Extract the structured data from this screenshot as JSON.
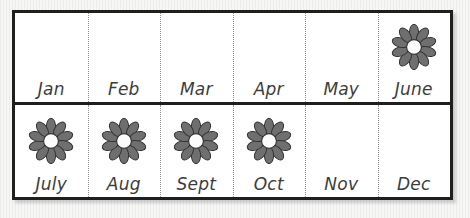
{
  "chart_data": {
    "type": "table",
    "title": "",
    "xlabel": "",
    "ylabel": "",
    "grid": {
      "rows": 2,
      "columns": 6
    },
    "symbol": {
      "name": "flower-icon",
      "petals": 10,
      "meaning": "flower blooms this month"
    },
    "categories": [
      "Jan",
      "Feb",
      "Mar",
      "Apr",
      "May",
      "June",
      "July",
      "Aug",
      "Sept",
      "Oct",
      "Nov",
      "Dec"
    ],
    "values": [
      0,
      0,
      0,
      0,
      0,
      1,
      1,
      1,
      1,
      1,
      0,
      0
    ],
    "legend_position": "none",
    "grid_on": true
  },
  "colors": {
    "frame_border": "#201f1f",
    "cell_background": "#ffffff",
    "separator": "#8e8e8e",
    "label_text": "#3c3c3c",
    "petal_fill": "#6f6f6f",
    "petal_stroke": "#333333",
    "flower_center": "#fbfbfb",
    "page_background": "#f2f2f0"
  },
  "rows": [
    {
      "name": "first-half",
      "cells": [
        {
          "label": "Jan",
          "icon": "",
          "icon_count": 0
        },
        {
          "label": "Feb",
          "icon": "",
          "icon_count": 0
        },
        {
          "label": "Mar",
          "icon": "",
          "icon_count": 0
        },
        {
          "label": "Apr",
          "icon": "",
          "icon_count": 0
        },
        {
          "label": "May",
          "icon": "",
          "icon_count": 0
        },
        {
          "label": "June",
          "icon": "flower-icon",
          "icon_count": 1
        }
      ]
    },
    {
      "name": "second-half",
      "cells": [
        {
          "label": "July",
          "icon": "flower-icon",
          "icon_count": 1
        },
        {
          "label": "Aug",
          "icon": "flower-icon",
          "icon_count": 1
        },
        {
          "label": "Sept",
          "icon": "flower-icon",
          "icon_count": 1
        },
        {
          "label": "Oct",
          "icon": "flower-icon",
          "icon_count": 1
        },
        {
          "label": "Nov",
          "icon": "",
          "icon_count": 0
        },
        {
          "label": "Dec",
          "icon": "",
          "icon_count": 0
        }
      ]
    }
  ]
}
